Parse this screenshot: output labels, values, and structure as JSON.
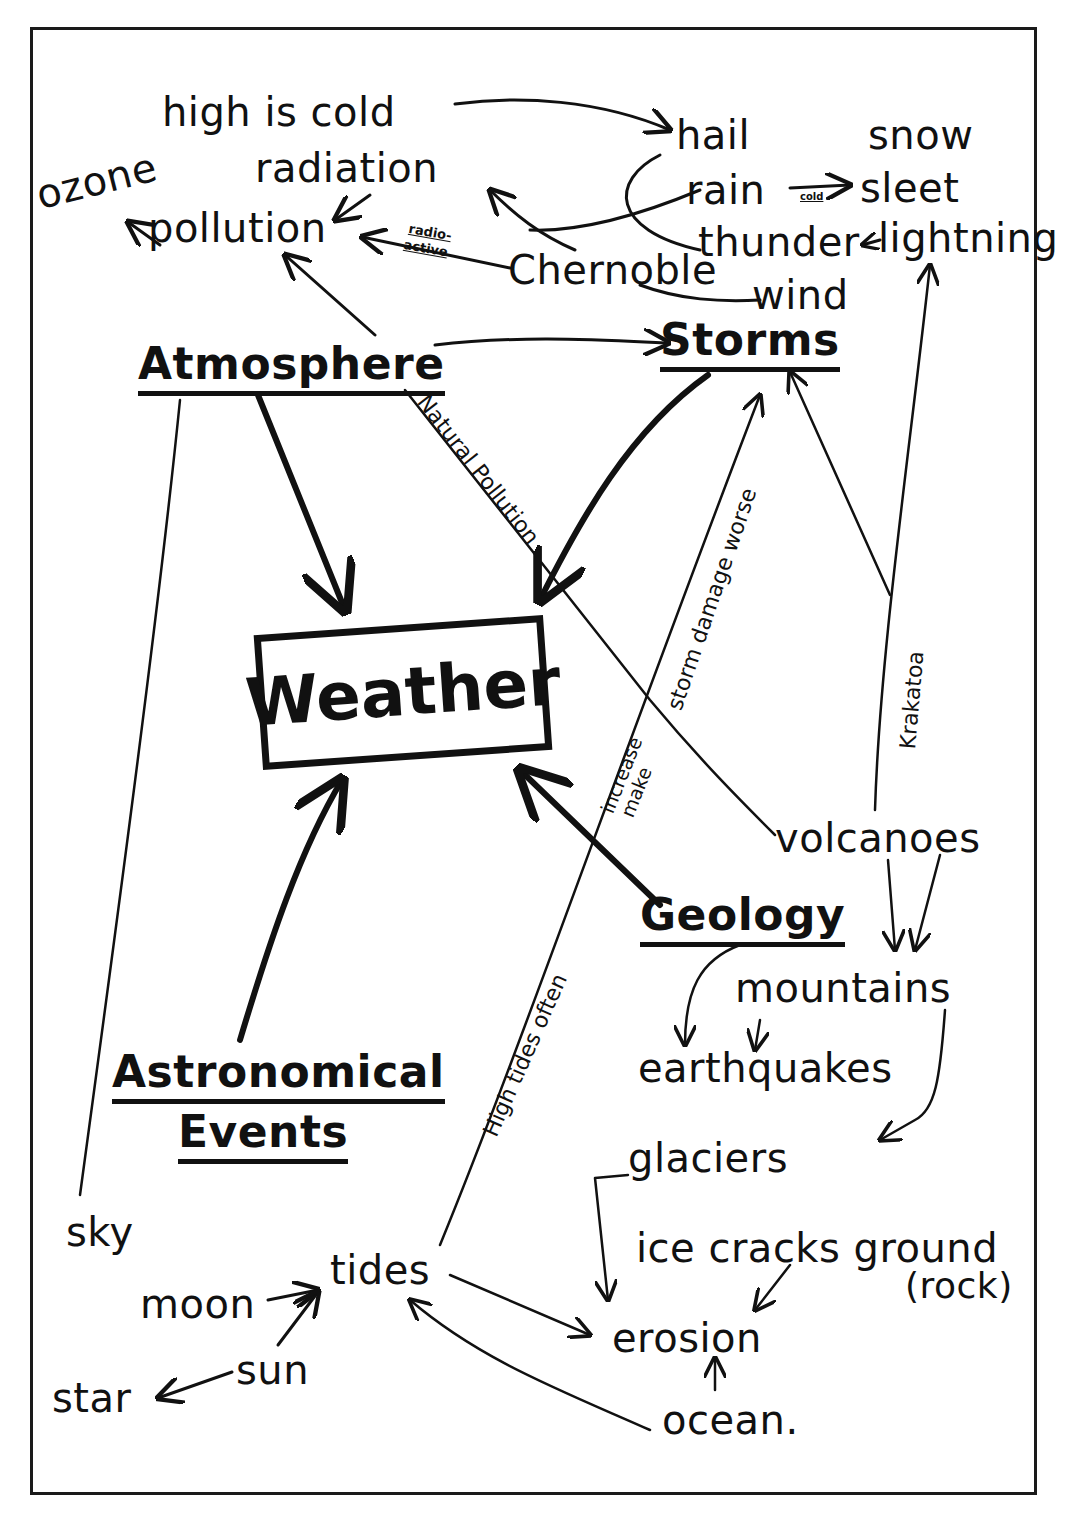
{
  "central": {
    "label": "Weather"
  },
  "major_nodes": {
    "atmosphere": "Atmosphere",
    "storms": "Storms",
    "geology": "Geology",
    "astronomical": [
      "Astronomical",
      "Events"
    ]
  },
  "nodes": {
    "high_is_cold": "high is cold",
    "hail": "hail",
    "snow": "snow",
    "radiation": "radiation",
    "ozone": "ozone",
    "pollution": "pollution",
    "rain": "rain",
    "sleet": "sleet",
    "thunder": "thunder",
    "lightning": "lightning",
    "chernoble": "Chernoble",
    "wind": "wind",
    "volcanoes": "volcanoes",
    "mountains": "mountains",
    "earthquakes": "earthquakes",
    "glaciers": "glaciers",
    "ice_cracks_ground": "ice cracks ground",
    "rock": "(rock)",
    "erosion": "erosion",
    "ocean": "ocean.",
    "sky": "sky",
    "tides": "tides",
    "moon": "moon",
    "sun": "sun",
    "star": "star"
  },
  "edge_labels": {
    "radioactive": [
      "radio-",
      "active"
    ],
    "rain_to_sleet": "cold",
    "natural_pollution": "Natural Pollution",
    "storm_damage": "storm damage worse",
    "increase_make": [
      "increase",
      "make"
    ],
    "krakatoa": "Krakatoa",
    "high_tides_often": "High tides often"
  },
  "edges": [
    {
      "from": "high is cold",
      "to": "hail"
    },
    {
      "from": "radiation",
      "to": "pollution"
    },
    {
      "from": "pollution",
      "to": "ozone"
    },
    {
      "from": "Chernoble",
      "to": "pollution",
      "label": "radio-active"
    },
    {
      "from": "Chernoble",
      "to": "radiation"
    },
    {
      "from": "rain",
      "to": "radiation"
    },
    {
      "from": "rain",
      "to": "sleet",
      "label": "cold"
    },
    {
      "from": "lightning",
      "to": "thunder"
    },
    {
      "from": "Chernoble",
      "to": "wind"
    },
    {
      "from": "Atmosphere",
      "to": "pollution"
    },
    {
      "from": "Atmosphere",
      "to": "Storms"
    },
    {
      "from": "Atmosphere",
      "to": "Weather"
    },
    {
      "from": "Atmosphere",
      "to": "volcanoes",
      "label": "Natural Pollution"
    },
    {
      "from": "Atmosphere",
      "to": "sky"
    },
    {
      "from": "Storms",
      "to": "Weather"
    },
    {
      "from": "tides",
      "to": "Storms",
      "label": "High tides often storm damage worse"
    },
    {
      "from": "Krakatoa",
      "to": "Storms"
    },
    {
      "from": "volcanoes",
      "to": "lightning",
      "label": "Krakatoa"
    },
    {
      "from": "Geology",
      "to": "Weather",
      "label": "increase make"
    },
    {
      "from": "volcanoes",
      "to": "mountains"
    },
    {
      "from": "Geology",
      "to": "earthquakes"
    },
    {
      "from": "mountains",
      "to": "earthquakes"
    },
    {
      "from": "mountains",
      "to": "glaciers"
    },
    {
      "from": "glaciers",
      "to": "erosion"
    },
    {
      "from": "ice cracks ground",
      "to": "erosion"
    },
    {
      "from": "ocean",
      "to": "erosion"
    },
    {
      "from": "ocean",
      "to": "tides"
    },
    {
      "from": "tides",
      "to": "erosion"
    },
    {
      "from": "Astronomical Events",
      "to": "Weather"
    },
    {
      "from": "moon",
      "to": "tides"
    },
    {
      "from": "sun",
      "to": "tides"
    },
    {
      "from": "sun",
      "to": "star"
    }
  ],
  "colors": {
    "ink": "#111111",
    "paper": "#ffffff",
    "frame": "#1a1a1a"
  }
}
